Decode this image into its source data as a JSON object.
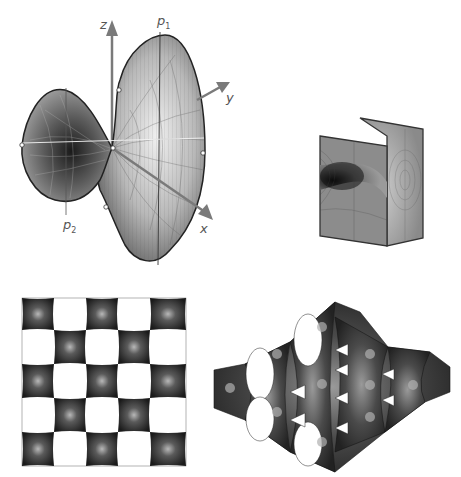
{
  "figure": {
    "panels": [
      {
        "id": "saddle-surface",
        "description": "Scherk-type saddle surface with axes",
        "axes": {
          "z_label": "z",
          "y_label": "y",
          "x_label": "x"
        },
        "points": {
          "p1_label": "p",
          "p1_sub": "1",
          "p2_label": "p",
          "p2_sub": "2"
        }
      },
      {
        "id": "two-plane-surface",
        "description": "Surface bridging two parallel planes"
      },
      {
        "id": "checkerboard-tiling",
        "description": "Doubly periodic Scherk surface, top view",
        "grid": "5x5"
      },
      {
        "id": "periodic-lattice",
        "description": "Doubly periodic Scherk surface, perspective view"
      }
    ],
    "colors": {
      "axis": "#7a7a7a",
      "surface_dark": "#2a2a2a",
      "surface_mid": "#8a8a8a",
      "surface_light": "#e6e6e6",
      "label": "#555555"
    }
  }
}
